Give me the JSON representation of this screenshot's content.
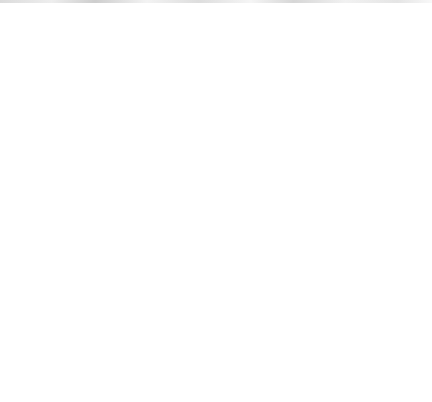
{
  "figure": {
    "kind": "3d-waterfall-spectra",
    "background": "#ffffff",
    "artifact_top_scanline": true
  },
  "axes": {
    "x": {
      "title": "Wellenzahl [cm",
      "title_sup": "-1",
      "title_tail": "]",
      "full_title": "Wellenzahl [cm-1]",
      "ticks": [
        "1740",
        "1720",
        "1700",
        "1680",
        "1660"
      ],
      "values": [
        1740,
        1720,
        1700,
        1680,
        1660
      ],
      "range": [
        1750,
        1650
      ],
      "minor_per_major": 2
    },
    "z": {
      "title_pre": "ln(I",
      "title_sub": "0",
      "title_post": "/I)",
      "full_title": "ln(I0/I)",
      "ticks": [
        "0.030",
        "0.025",
        "0.020",
        "0.015",
        "0.010",
        "0.005",
        "0.000"
      ],
      "values": [
        0.03,
        0.025,
        0.02,
        0.015,
        0.01,
        0.005,
        0.0
      ],
      "range": [
        0.0,
        0.032
      ]
    },
    "t": {
      "title": "t [s]",
      "ticks": [
        "20",
        "15",
        "10",
        "5",
        "0"
      ],
      "values": [
        20,
        15,
        10,
        5,
        0
      ],
      "range": [
        0,
        24
      ]
    }
  },
  "colors": {
    "axis": "#000000",
    "grid": "#9a9a9a",
    "trace_dark": "#111111",
    "trace_light": "#8a8a8a",
    "text": "#111111"
  },
  "chart_data": {
    "type": "line",
    "title": "",
    "xlabel": "Wellenzahl [cm-1]",
    "ylabel": "ln(I0/I)",
    "zlabel": "t [s]",
    "xlim": [
      1750,
      1650
    ],
    "ylim": [
      0.0,
      0.032
    ],
    "zlim": [
      0,
      24
    ],
    "grid": true,
    "legend": "none",
    "x": [
      1750,
      1746,
      1742,
      1738,
      1734,
      1730,
      1726,
      1722,
      1718,
      1714,
      1710,
      1706,
      1702,
      1700,
      1698,
      1696,
      1694,
      1690,
      1686,
      1682,
      1678,
      1674,
      1670,
      1666,
      1662,
      1658,
      1654,
      1650
    ],
    "series": [
      {
        "name": "t = 0 s",
        "t": 0,
        "color": "trace_dark",
        "values": [
          0.0012,
          0.001,
          0.0014,
          0.0011,
          0.0015,
          0.0012,
          0.0016,
          0.0013,
          0.0018,
          0.0016,
          0.002,
          0.0024,
          0.003,
          0.0032,
          0.0029,
          0.0025,
          0.0022,
          0.0019,
          0.0017,
          0.0015,
          0.0014,
          0.0013,
          0.0012,
          0.0013,
          0.0011,
          0.0012,
          0.001,
          0.0011
        ]
      },
      {
        "name": "t = 2 s",
        "t": 2,
        "color": "trace_light",
        "values": [
          0.0014,
          0.0012,
          0.0016,
          0.0013,
          0.0017,
          0.0015,
          0.0019,
          0.0017,
          0.0023,
          0.0022,
          0.003,
          0.0038,
          0.005,
          0.0054,
          0.0048,
          0.004,
          0.0034,
          0.0028,
          0.0024,
          0.0021,
          0.0018,
          0.0016,
          0.0015,
          0.0014,
          0.0013,
          0.0013,
          0.0012,
          0.0012
        ]
      },
      {
        "name": "t = 4 s",
        "t": 4,
        "color": "trace_dark",
        "values": [
          0.0015,
          0.0013,
          0.0017,
          0.0015,
          0.0019,
          0.0017,
          0.0022,
          0.0021,
          0.0028,
          0.003,
          0.0042,
          0.0056,
          0.0074,
          0.008,
          0.007,
          0.0058,
          0.0047,
          0.0037,
          0.003,
          0.0026,
          0.0022,
          0.0019,
          0.0017,
          0.0016,
          0.0015,
          0.0014,
          0.0013,
          0.0013
        ]
      },
      {
        "name": "t = 6 s",
        "t": 6,
        "color": "trace_light",
        "values": [
          0.0016,
          0.0014,
          0.0018,
          0.0016,
          0.0021,
          0.0019,
          0.0025,
          0.0025,
          0.0034,
          0.0039,
          0.0056,
          0.0076,
          0.01,
          0.0108,
          0.0094,
          0.0077,
          0.0061,
          0.0046,
          0.0037,
          0.0031,
          0.0026,
          0.0022,
          0.0019,
          0.0018,
          0.0016,
          0.0015,
          0.0014,
          0.0014
        ]
      },
      {
        "name": "t = 8 s",
        "t": 8,
        "color": "trace_dark",
        "values": [
          0.0017,
          0.0015,
          0.0019,
          0.0017,
          0.0023,
          0.0021,
          0.0029,
          0.003,
          0.0042,
          0.005,
          0.0072,
          0.0098,
          0.0128,
          0.0138,
          0.012,
          0.0097,
          0.0076,
          0.0056,
          0.0044,
          0.0036,
          0.003,
          0.0025,
          0.0021,
          0.0019,
          0.0017,
          0.0016,
          0.0015,
          0.0014
        ]
      },
      {
        "name": "t = 10 s",
        "t": 10,
        "color": "trace_light",
        "values": [
          0.0018,
          0.0016,
          0.002,
          0.0018,
          0.0025,
          0.0023,
          0.0033,
          0.0035,
          0.0051,
          0.0062,
          0.009,
          0.0122,
          0.0158,
          0.017,
          0.0148,
          0.0118,
          0.0091,
          0.0066,
          0.0051,
          0.0041,
          0.0033,
          0.0027,
          0.0023,
          0.002,
          0.0018,
          0.0017,
          0.0016,
          0.0015
        ]
      },
      {
        "name": "t = 12 s",
        "t": 12,
        "color": "trace_dark",
        "values": [
          0.0019,
          0.0017,
          0.0021,
          0.0019,
          0.0027,
          0.0025,
          0.0037,
          0.0041,
          0.006,
          0.0075,
          0.0109,
          0.0147,
          0.019,
          0.0204,
          0.0177,
          0.014,
          0.0107,
          0.0076,
          0.0058,
          0.0046,
          0.0036,
          0.0029,
          0.0024,
          0.0021,
          0.0019,
          0.0018,
          0.0016,
          0.0015
        ]
      },
      {
        "name": "t = 14 s",
        "t": 14,
        "color": "trace_light",
        "values": [
          0.002,
          0.0018,
          0.0022,
          0.002,
          0.0028,
          0.0027,
          0.0041,
          0.0046,
          0.0069,
          0.0087,
          0.0127,
          0.0171,
          0.022,
          0.0236,
          0.0204,
          0.0161,
          0.0122,
          0.0086,
          0.0064,
          0.005,
          0.0039,
          0.0031,
          0.0025,
          0.0022,
          0.002,
          0.0018,
          0.0017,
          0.0016
        ]
      },
      {
        "name": "t = 16 s",
        "t": 16,
        "color": "trace_dark",
        "values": [
          0.0021,
          0.0019,
          0.0023,
          0.0021,
          0.003,
          0.0029,
          0.0045,
          0.0051,
          0.0077,
          0.0098,
          0.0143,
          0.0193,
          0.0247,
          0.0265,
          0.0229,
          0.018,
          0.0135,
          0.0094,
          0.0069,
          0.0053,
          0.0041,
          0.0033,
          0.0027,
          0.0023,
          0.002,
          0.0019,
          0.0017,
          0.0016
        ]
      },
      {
        "name": "t = 18 s",
        "t": 18,
        "color": "trace_light",
        "values": [
          0.0021,
          0.0019,
          0.0024,
          0.0022,
          0.0031,
          0.003,
          0.0048,
          0.0055,
          0.0084,
          0.0107,
          0.0156,
          0.021,
          0.0268,
          0.0287,
          0.0248,
          0.0195,
          0.0145,
          0.01,
          0.0073,
          0.0056,
          0.0043,
          0.0034,
          0.0028,
          0.0024,
          0.0021,
          0.0019,
          0.0018,
          0.0017
        ]
      },
      {
        "name": "t = 20 s",
        "t": 20,
        "color": "trace_dark",
        "values": [
          0.0022,
          0.002,
          0.0024,
          0.0022,
          0.0032,
          0.0031,
          0.005,
          0.0058,
          0.0089,
          0.0114,
          0.0166,
          0.0223,
          0.0284,
          0.0304,
          0.0262,
          0.0206,
          0.0153,
          0.0105,
          0.0076,
          0.0058,
          0.0045,
          0.0036,
          0.0029,
          0.0025,
          0.0022,
          0.002,
          0.0018,
          0.0017
        ]
      },
      {
        "name": "t = 22 s",
        "t": 22,
        "color": "trace_light",
        "values": [
          0.0022,
          0.002,
          0.0025,
          0.0023,
          0.0032,
          0.0031,
          0.0051,
          0.006,
          0.0092,
          0.0118,
          0.0172,
          0.0231,
          0.0294,
          0.0315,
          0.0271,
          0.0213,
          0.0158,
          0.0108,
          0.0078,
          0.006,
          0.0046,
          0.0036,
          0.003,
          0.0025,
          0.0022,
          0.002,
          0.0019,
          0.0017
        ]
      },
      {
        "name": "t = 24 s",
        "t": 24,
        "color": "trace_dark",
        "values": [
          0.0023,
          0.0021,
          0.0025,
          0.0023,
          0.0033,
          0.0032,
          0.0052,
          0.0061,
          0.0094,
          0.0121,
          0.0176,
          0.0236,
          0.03,
          0.0321,
          0.0277,
          0.0217,
          0.0161,
          0.011,
          0.0079,
          0.0061,
          0.0047,
          0.0037,
          0.003,
          0.0026,
          0.0022,
          0.0021,
          0.0019,
          0.0018
        ]
      }
    ]
  }
}
